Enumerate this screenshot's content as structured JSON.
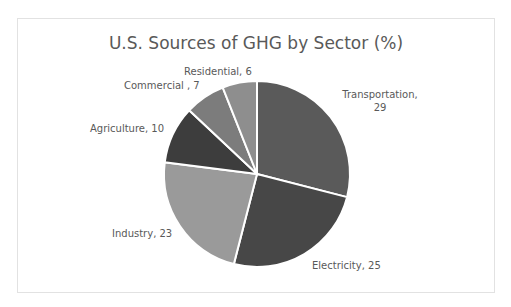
{
  "chart": {
    "title": "U.S. Sources of GHG by Sector (%)"
  },
  "labels": {
    "transportation": "Transportation,",
    "transportation_value": "29",
    "electricity": "Electricity, 25",
    "industry": "Industry, 23",
    "agriculture": "Agriculture, 10",
    "commercial": "Commercial , 7",
    "residential": "Residential, 6"
  },
  "chart_data": {
    "type": "pie",
    "title": "U.S. Sources of GHG by Sector (%)",
    "categories": [
      "Transportation",
      "Electricity",
      "Industry",
      "Agriculture",
      "Commercial",
      "Residential"
    ],
    "values": [
      29,
      25,
      23,
      10,
      7,
      6
    ],
    "colors": [
      "#5a5a5a",
      "#474747",
      "#9a9a9a",
      "#3d3d3d",
      "#7c7c7c",
      "#8e8e8e"
    ],
    "data_labels": [
      "Transportation, 29",
      "Electricity, 25",
      "Industry, 23",
      "Agriculture, 10",
      "Commercial , 7",
      "Residential, 6"
    ],
    "legend": "none",
    "start_angle": "12 o'clock, clockwise"
  }
}
